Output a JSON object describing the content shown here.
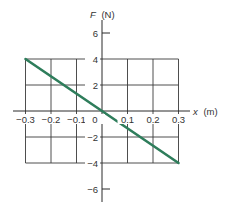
{
  "chart_data": {
    "type": "line",
    "title": "",
    "xlabel_var": "x",
    "xlabel_unit": "(m)",
    "ylabel_var": "F",
    "ylabel_unit": "(N)",
    "xlim": [
      -0.3,
      0.3
    ],
    "ylim": [
      -4,
      4
    ],
    "y_axis_extent": [
      -7,
      7
    ],
    "x_ticks": [
      -0.3,
      -0.2,
      -0.1,
      0,
      0.1,
      0.2,
      0.3
    ],
    "x_tick_labels": [
      "−0.3",
      "−0.2",
      "−0.1",
      "0",
      "0.1",
      "0.2",
      "0.3"
    ],
    "y_ticks": [
      6,
      4,
      2,
      -2,
      -4,
      -6
    ],
    "y_tick_labels": [
      "6",
      "4",
      "2",
      "−2",
      "−4",
      "−6"
    ],
    "grid": true,
    "legend": "none",
    "series": [
      {
        "name": "F(x)",
        "color": "#2e7d5b",
        "x": [
          -0.3,
          0.3
        ],
        "y": [
          4,
          -4
        ]
      }
    ]
  }
}
